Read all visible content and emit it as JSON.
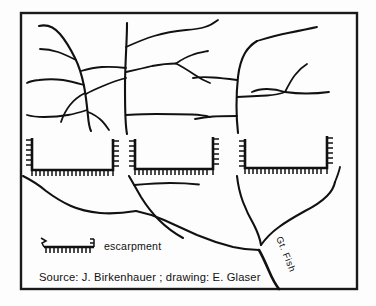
{
  "map": {
    "title": "Drainage and escarpment map of the Great Fish River",
    "background_color": "#fdfdfd",
    "ink_color": "#111111",
    "frame": {
      "x": 21,
      "y": 13,
      "width": 336,
      "height": 276
    },
    "labels": {
      "river_label": "Gt. Fish",
      "legend_label": "escarpment",
      "caption": "Source: J. Birkenhauer ;    drawing: E. Glaser"
    },
    "legend": {
      "symbol_name": "escarpment-hachure-symbol",
      "label": "escarpment",
      "tick_count": 11
    },
    "escarpments": [
      {
        "name": "escarpment-west",
        "tick_count_bottom": 20,
        "tick_count_left": 7,
        "tick_count_right": 7
      },
      {
        "name": "escarpment-central",
        "tick_count_bottom": 20,
        "tick_count_left": 7,
        "tick_count_right": 7
      },
      {
        "name": "escarpment-east",
        "tick_count_bottom": 20,
        "tick_count_left": 7,
        "tick_count_right": 7
      }
    ],
    "features": [
      "dendritic tributary network in upper half",
      "three hachured escarpment brackets across the middle",
      "main trunk stream converging to the lower right",
      "Gt. Fish river exiting the bottom of the frame"
    ]
  }
}
